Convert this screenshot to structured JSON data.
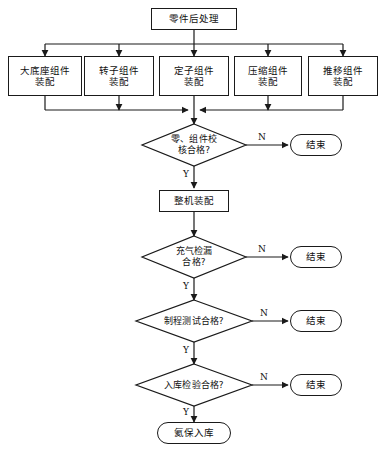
{
  "diagram": {
    "title_node": {
      "label": "零件后处理"
    },
    "assembly_nodes": [
      {
        "label": "大底座组件\n装配"
      },
      {
        "label": "转子组件\n装配"
      },
      {
        "label": "定子组件\n装配"
      },
      {
        "label": "压缩组件\n装配"
      },
      {
        "label": "推移组件\n装配"
      }
    ],
    "decisions": [
      {
        "label": "零、组件校\n核合格?",
        "yes": "Y",
        "no": "N"
      },
      {
        "label": "充气检漏\n合格?",
        "yes": "Y",
        "no": "N"
      },
      {
        "label": "制程测试合格?",
        "yes": "Y",
        "no": "N"
      },
      {
        "label": "入库检验合格?",
        "yes": "Y",
        "no": "N"
      }
    ],
    "process_nodes": [
      {
        "label": "整机装配"
      }
    ],
    "end_nodes": [
      {
        "label": "结束"
      },
      {
        "label": "结束"
      },
      {
        "label": "结束"
      },
      {
        "label": "结束"
      }
    ],
    "final_node": {
      "label": "氦保入库"
    },
    "colors": {
      "stroke": "#1a1a1a",
      "background": "#ffffff",
      "text": "#111111"
    }
  }
}
